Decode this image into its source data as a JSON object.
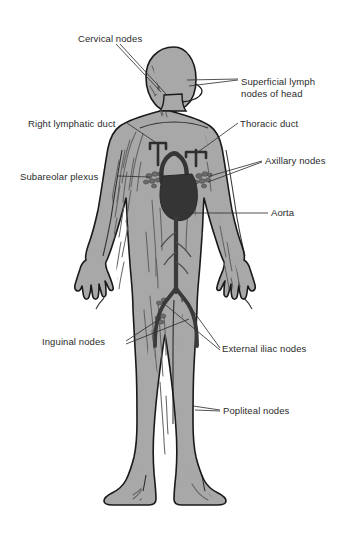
{
  "diagram": {
    "background_color": "#ffffff",
    "body_fill_color": "#a8a8a8",
    "body_outline_color": "#1a1a1a",
    "heart_color": "#353535",
    "vessel_color": "#5e5e5e",
    "node_color": "#6b6b6b",
    "label_color": "#2b2b2b",
    "leader_color": "#333333"
  },
  "labels": [
    {
      "id": "cervical-nodes",
      "text": "Cervical nodes",
      "x": 78,
      "y": 33,
      "lines": [
        "Cervical nodes"
      ]
    },
    {
      "id": "superficial-lymph-head",
      "text": "Superficial lymph nodes of head",
      "x": 241,
      "y": 76,
      "lines": [
        "Superficial lymph",
        "nodes of head"
      ]
    },
    {
      "id": "right-lymphatic-duct",
      "text": "Right lymphatic duct",
      "x": 28,
      "y": 118,
      "lines": [
        "Right lymphatic duct"
      ]
    },
    {
      "id": "thoracic-duct",
      "text": "Thoracic duct",
      "x": 240,
      "y": 118,
      "lines": [
        "Thoracic duct"
      ]
    },
    {
      "id": "axillary-nodes",
      "text": "Axillary nodes",
      "x": 265,
      "y": 157,
      "lines": [
        "Axillary nodes"
      ]
    },
    {
      "id": "subareolar-plexus",
      "text": "Subareolar plexus",
      "x": 20,
      "y": 171,
      "lines": [
        "Subareolar plexus"
      ]
    },
    {
      "id": "aorta",
      "text": "Aorta",
      "x": 271,
      "y": 209,
      "lines": [
        "Aorta"
      ]
    },
    {
      "id": "inguinal-nodes",
      "text": "Inguinal nodes",
      "x": 42,
      "y": 336,
      "lines": [
        "Inguinal nodes"
      ]
    },
    {
      "id": "external-iliac-nodes",
      "text": "External iliac nodes",
      "x": 222,
      "y": 344,
      "lines": [
        "External iliac nodes"
      ]
    },
    {
      "id": "popliteal-nodes",
      "text": "Popliteal nodes",
      "x": 223,
      "y": 406,
      "lines": [
        "Popliteal nodes"
      ]
    }
  ]
}
